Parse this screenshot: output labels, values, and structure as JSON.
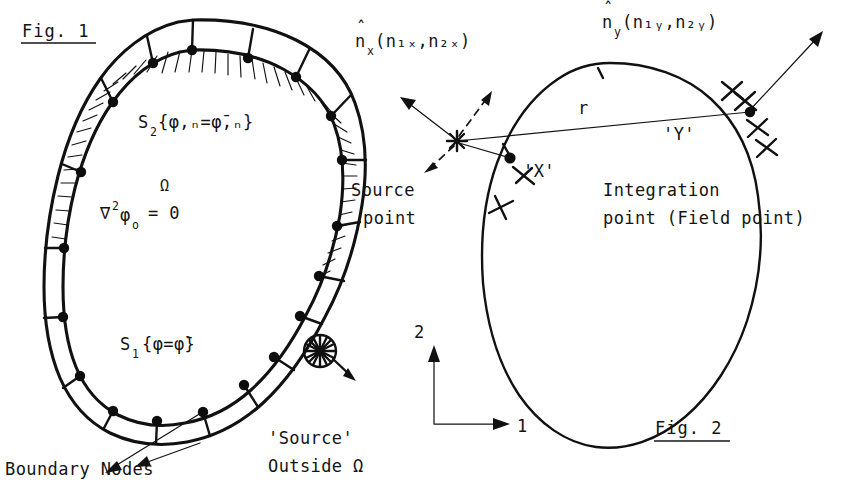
{
  "figure1": {
    "caption": "Fig. 1",
    "domain_symbol": "Ω",
    "governing_equation": {
      "operator": "∇",
      "operator_power": "2",
      "field": "φ",
      "field_sub": "o",
      "equals": "= 0",
      "full": "∇²φₒ = 0"
    },
    "neumann_boundary": {
      "symbol": "S",
      "sub": "2",
      "condition": "{φ,ₙ=φ̄,ₙ}",
      "full": "S₂{φ,ₙ=φ̄,ₙ}"
    },
    "dirichlet_boundary": {
      "symbol": "S",
      "sub": "1",
      "condition": "{φ=φ̄}",
      "full": "S₁{φ=φ̄}"
    },
    "boundary_nodes_label": "Boundary Nodes",
    "source_outside_label_line1": "'Source'",
    "source_outside_label_line2": "Outside Ω",
    "element_count": 18,
    "node_count": 18
  },
  "figure2": {
    "caption": "Fig. 2",
    "normal_x": {
      "base": "n",
      "hat": "̂",
      "sub": "x",
      "components": "(n₁ₓ,n₂ₓ)",
      "full": "n̂ₓ(n₁ₓ,n₂ₓ)"
    },
    "normal_y": {
      "base": "n",
      "hat": "̂",
      "sub": "y",
      "components": "(n₁ᵧ,n₂ᵧ)",
      "full": "n̂ᵧ(n₁ᵧ,n₂ᵧ)"
    },
    "distance_label": "r",
    "source_point_marker": "'X'",
    "field_point_marker": "'Y'",
    "source_point_label_line1": "Source",
    "source_point_label_line2": "point",
    "integration_point_label_line1": "Integration",
    "integration_point_label_line2": "point (Field point)",
    "axes": {
      "axis_1_label": "1",
      "axis_2_label": "2"
    }
  },
  "style": {
    "ink_color": "#111111",
    "paper_color": "#ffffff"
  }
}
